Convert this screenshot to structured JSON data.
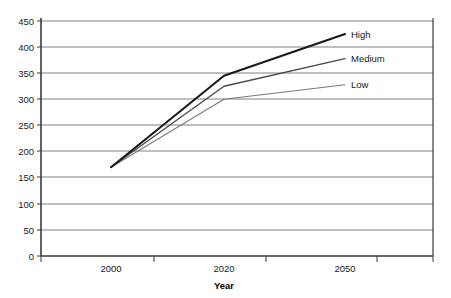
{
  "chart_data": {
    "type": "line",
    "title": "",
    "xlabel": "Year",
    "ylabel": "",
    "x": [
      2000,
      2020,
      2050
    ],
    "categories": [
      "2000",
      "2020",
      "2050"
    ],
    "xtick_labels": [
      "2000",
      "2020",
      "2050"
    ],
    "ytick_labels": [
      "0",
      "50",
      "100",
      "150",
      "200",
      "250",
      "300",
      "350",
      "400",
      "450"
    ],
    "yticks": [
      0,
      50,
      100,
      150,
      200,
      250,
      300,
      350,
      400,
      450
    ],
    "ylim": [
      0,
      450
    ],
    "grid": "horizontal",
    "legend_position": "right-inline",
    "series": [
      {
        "name": "High",
        "values": [
          170,
          345,
          425
        ],
        "color": "#1a1a1a",
        "width": 2.1
      },
      {
        "name": "Medium",
        "values": [
          170,
          325,
          378
        ],
        "color": "#4a4a4a",
        "width": 1.4
      },
      {
        "name": "Low",
        "values": [
          170,
          300,
          328
        ],
        "color": "#7a7a7a",
        "width": 1.1
      }
    ]
  },
  "axes": {
    "x_axis_title": "Year",
    "y_tick_0": "0",
    "y_tick_50": "50",
    "y_tick_100": "100",
    "y_tick_150": "150",
    "y_tick_200": "200",
    "y_tick_250": "250",
    "y_tick_300": "300",
    "y_tick_350": "350",
    "y_tick_400": "400",
    "y_tick_450": "450",
    "x_tick_2000": "2000",
    "x_tick_2020": "2020",
    "x_tick_2050": "2050"
  },
  "series_labels": {
    "high": "High",
    "medium": "Medium",
    "low": "Low"
  },
  "colors": {
    "high_line": "#1a1a1a",
    "medium_line": "#4a4a4a",
    "low_line": "#7a7a7a",
    "gridline": "#808080",
    "axis": "#3a3a3a",
    "background": "#ffffff"
  }
}
